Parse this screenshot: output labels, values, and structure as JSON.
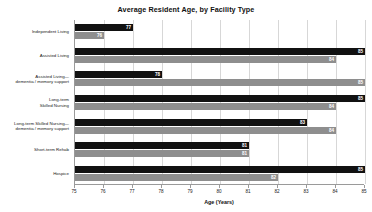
{
  "chart_data": {
    "type": "bar",
    "orientation": "horizontal",
    "title": "Average Resident Age, by Facility Type",
    "xlabel": "Age (Years)",
    "ylabel": "",
    "xlim": [
      75,
      85
    ],
    "xticks": [
      75,
      76,
      77,
      78,
      79,
      80,
      81,
      82,
      83,
      84,
      85
    ],
    "xticklabels": [
      "75",
      "76",
      "77",
      "78",
      "79",
      "80",
      "81",
      "82",
      "83",
      "84",
      "85"
    ],
    "grid": true,
    "grid_axis": "x",
    "legend": false,
    "categories": [
      "Independent Living",
      "Assisted Living",
      "Assisted Living—\ndementia / memory support",
      "Long-term\nSkilled Nursing",
      "Long-term Skilled Nursing—\ndementia / memory support",
      "Short-term Rehab",
      "Hospice"
    ],
    "series": [
      {
        "name": "Series 1",
        "color": "#111111",
        "values": [
          77,
          85,
          78,
          85,
          83,
          81,
          85
        ]
      },
      {
        "name": "Series 2",
        "color": "#8e8e8e",
        "values": [
          76,
          84,
          85,
          84,
          84,
          81,
          82
        ]
      }
    ],
    "bar_labels": [
      [
        "77",
        "85",
        "78",
        "85",
        "83",
        "81",
        "85"
      ],
      [
        "76",
        "84",
        "85",
        "84",
        "84",
        "81",
        "82"
      ]
    ]
  }
}
